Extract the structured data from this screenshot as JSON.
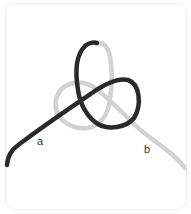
{
  "figure": {
    "type": "knot-tying diagram",
    "labels": {
      "a": "a",
      "b": "b"
    },
    "colors": {
      "dark_cord": "#2a2a2a",
      "light_cord": "#d2d2d2",
      "background": "#ffffff",
      "border": "#f0f0f0"
    }
  }
}
